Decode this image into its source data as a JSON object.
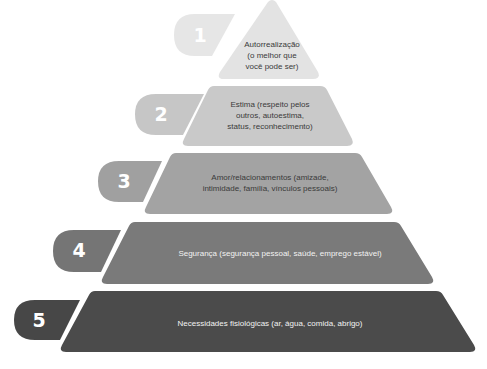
{
  "diagram": {
    "type": "pyramid",
    "title": "",
    "levels": [
      {
        "number": "1",
        "label": "Autorrealização (o melhor que você pode ser)",
        "lines": [
          "Autorrealização",
          "(o melhor que",
          "você pode ser)"
        ],
        "color": "#e3e3e3",
        "badge_color": "#e6e6e6"
      },
      {
        "number": "2",
        "label": "Estima (respeito pelos outros, autoestima, status, reconhecimento)",
        "lines": [
          "Estima (respeito pelos",
          "outros, autoestima,",
          "status, reconhecimento)"
        ],
        "color": "#c9c9c9",
        "badge_color": "#c6c6c6"
      },
      {
        "number": "3",
        "label": "Amor/relacionamentos (amizade, intimidade, família, vínculos pessoais)",
        "lines": [
          "Amor/relacionamentos (amizade,",
          "intimidade, família, vínculos pessoais)"
        ],
        "color": "#a3a3a3",
        "badge_color": "#a0a0a0"
      },
      {
        "number": "4",
        "label": "Segurança (segurança pessoal, saúde, emprego estável)",
        "lines": [
          "Segurança (segurança pessoal, saúde, emprego estável)"
        ],
        "color": "#7a7a7a",
        "badge_color": "#757575"
      },
      {
        "number": "5",
        "label": "Necessidades fisiológicas (ar, água, comida, abrigo)",
        "lines": [
          "Necessidades fisiológicas (ar, água, comida, abrigo)"
        ],
        "color": "#4b4b4b",
        "badge_color": "#474747"
      }
    ]
  }
}
